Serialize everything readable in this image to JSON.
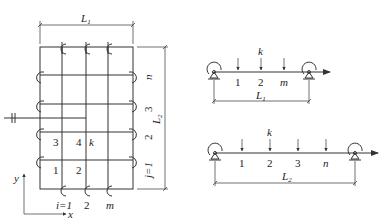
{
  "grid": {
    "dim_top_label": "L",
    "dim_top_sub": "1",
    "dim_right_label": "L",
    "dim_right_sub": "2",
    "row_labels": [
      "n",
      "3",
      "2",
      "j=1"
    ],
    "col_labels": [
      "i=1",
      "2",
      "m"
    ],
    "cell_labels": [
      "3",
      "4",
      "k",
      "1",
      "2"
    ],
    "axis_x": "x",
    "axis_y": "y"
  },
  "beam1": {
    "load_labels": [
      "1",
      "2",
      "m"
    ],
    "top_label": "k",
    "dim_label": "L",
    "dim_sub": "1"
  },
  "beam2": {
    "load_labels": [
      "1",
      "2",
      "3",
      "n"
    ],
    "top_label": "k",
    "dim_label": "L",
    "dim_sub": "2"
  },
  "colors": {
    "stroke": "#333333",
    "background": "#ffffff"
  }
}
